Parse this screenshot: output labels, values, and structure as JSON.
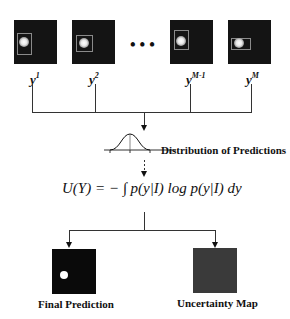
{
  "samples": [
    {
      "label_base": "y",
      "label_sup": "1"
    },
    {
      "label_base": "y",
      "label_sup": "2"
    },
    {
      "label_base": "y",
      "label_sup": "M-1"
    },
    {
      "label_base": "y",
      "label_sup": "M"
    }
  ],
  "ellipsis": "•••",
  "distribution": {
    "label": "Distribution of Predictions"
  },
  "formula": {
    "text": "U(Y) = − ∫ p(y|I) log p(y|I) dy"
  },
  "outputs": {
    "final_prediction": {
      "label": "Final Prediction"
    },
    "uncertainty_map": {
      "label": "Uncertainty Map"
    }
  },
  "colors": {
    "sample_bg": "#141414",
    "uncertainty_bg": "#3a3a3a",
    "prediction_bg": "#0a0a0a",
    "lines": "#333333"
  }
}
